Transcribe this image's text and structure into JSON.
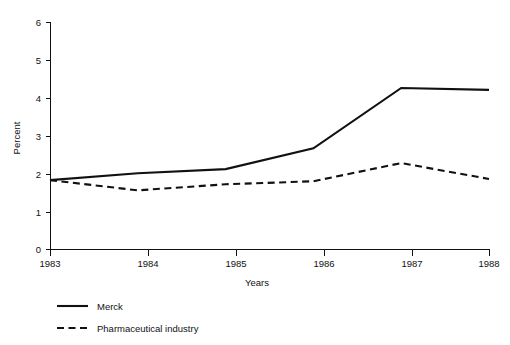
{
  "chart_data": {
    "type": "line",
    "title": "",
    "subtitle": "",
    "xlabel": "Years",
    "ylabel": "Percent",
    "categories": [
      "1983",
      "1984",
      "1985",
      "1986",
      "1987",
      "1988"
    ],
    "x": [
      1983,
      1984,
      1985,
      1986,
      1987,
      1988
    ],
    "series": [
      {
        "name": "Merck",
        "style": "solid",
        "color": "#111111",
        "values": [
          1.83,
          2.01,
          2.12,
          2.67,
          4.26,
          4.21
        ]
      },
      {
        "name": "Pharmaceutical industry",
        "style": "dashed",
        "color": "#111111",
        "values": [
          1.83,
          1.56,
          1.72,
          1.8,
          2.28,
          1.86
        ]
      }
    ],
    "xlim": [
      1983,
      1988
    ],
    "ylim": [
      0,
      6
    ],
    "yticks": [
      "0",
      "1",
      "2",
      "3",
      "4",
      "5",
      "6"
    ],
    "ytick_values": [
      0,
      1,
      2,
      3,
      4,
      5,
      6
    ],
    "xticks": [
      "1983",
      "1984",
      "1985",
      "1986",
      "1987",
      "1988"
    ],
    "grid": false,
    "legend_position": "below-left",
    "legend_entries": [
      "Merck",
      "Pharmaceutical industry"
    ]
  },
  "axes": {
    "y_title": "Percent",
    "x_title": "Years",
    "y_tick_0": "0",
    "y_tick_1": "1",
    "y_tick_2": "2",
    "y_tick_3": "3",
    "y_tick_4": "4",
    "y_tick_5": "5",
    "y_tick_6": "6",
    "x_tick_0": "1983",
    "x_tick_1": "1984",
    "x_tick_2": "1985",
    "x_tick_3": "1986",
    "x_tick_4": "1987",
    "x_tick_5": "1988"
  },
  "legend": {
    "item_0_label": "Merck",
    "item_1_label": "Pharmaceutical industry"
  }
}
